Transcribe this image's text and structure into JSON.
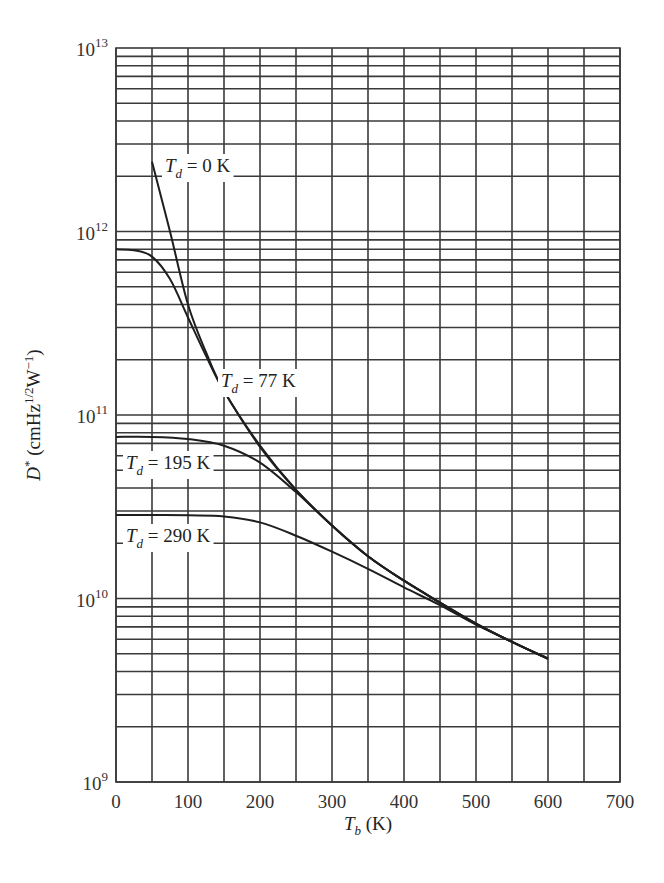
{
  "chart_data": {
    "type": "line",
    "title": "",
    "xlabel": "T_b (K)",
    "xlabel_main": "T",
    "xlabel_sub": "b",
    "xlabel_unit": " (K)",
    "ylabel": "D* (cmHz^1/2 W^-1)",
    "ylabel_parts": {
      "main": "D",
      "star": "*",
      "unit_open": " (cmHz",
      "sup1": "1/2",
      "unit_mid": "W",
      "sup2": "−1",
      "unit_close": ")"
    },
    "xlim": [
      0,
      700
    ],
    "ylim": [
      1000000000.0,
      10000000000000.0
    ],
    "yscale": "log",
    "grid": true,
    "x_ticks": [
      0,
      100,
      200,
      300,
      400,
      500,
      600,
      700
    ],
    "x_minor_grid": [
      50,
      150,
      250,
      350,
      450,
      550,
      650
    ],
    "y_ticks": [
      {
        "base": "10",
        "exp": "9",
        "value": 1000000000.0
      },
      {
        "base": "10",
        "exp": "10",
        "value": 10000000000.0
      },
      {
        "base": "10",
        "exp": "11",
        "value": 100000000000.0
      },
      {
        "base": "10",
        "exp": "12",
        "value": 1000000000000.0
      },
      {
        "base": "10",
        "exp": "13",
        "value": 10000000000000.0
      }
    ],
    "legend_position": "inline labels",
    "series": [
      {
        "name": "T_d = 0 K",
        "label_main": "T",
        "label_sub": "d",
        "label_rest": " = 0 K",
        "label_pos": [
          165,
          172
        ],
        "x": [
          50,
          75,
          100,
          125,
          150,
          200,
          250,
          300,
          350,
          400,
          450,
          500,
          550,
          600
        ],
        "values": [
          2400000000000.0,
          1000000000000.0,
          400000000000.0,
          220000000000.0,
          135000000000.0,
          68000000000.0,
          39000000000.0,
          25000000000.0,
          17000000000.0,
          12500000000.0,
          9500000000.0,
          7300000000.0,
          5800000000.0,
          4700000000.0
        ]
      },
      {
        "name": "T_d = 77 K",
        "label_main": "T",
        "label_sub": "d",
        "label_rest": " = 77 K",
        "label_pos": [
          221,
          387
        ],
        "x": [
          0,
          25,
          50,
          75,
          100,
          125,
          150,
          200,
          250,
          300,
          350,
          400,
          450,
          500,
          550,
          600
        ],
        "values": [
          800000000000.0,
          790000000000.0,
          730000000000.0,
          550000000000.0,
          340000000000.0,
          210000000000.0,
          135000000000.0,
          67000000000.0,
          39000000000.0,
          25000000000.0,
          17000000000.0,
          12500000000.0,
          9500000000.0,
          7300000000.0,
          5800000000.0,
          4700000000.0
        ]
      },
      {
        "name": "T_d = 195 K",
        "label_main": "T",
        "label_sub": "d",
        "label_rest": " = 195 K",
        "label_pos": [
          126,
          469
        ],
        "x": [
          0,
          50,
          100,
          150,
          200,
          250,
          300,
          350,
          400,
          450,
          500,
          550,
          600
        ],
        "values": [
          76000000000.0,
          76000000000.0,
          74000000000.0,
          68000000000.0,
          55000000000.0,
          38000000000.0,
          25000000000.0,
          17000000000.0,
          12500000000.0,
          9500000000.0,
          7300000000.0,
          5800000000.0,
          4700000000.0
        ]
      },
      {
        "name": "T_d = 290 K",
        "label_main": "T",
        "label_sub": "d",
        "label_rest": " = 290 K",
        "label_pos": [
          126,
          542
        ],
        "x": [
          0,
          50,
          100,
          150,
          200,
          250,
          300,
          350,
          400,
          450,
          500,
          550,
          600
        ],
        "values": [
          28500000000.0,
          28500000000.0,
          28400000000.0,
          28000000000.0,
          26000000000.0,
          22000000000.0,
          18000000000.0,
          14500000000.0,
          11500000000.0,
          9200000000.0,
          7200000000.0,
          5800000000.0,
          4700000000.0
        ]
      }
    ]
  },
  "layout": {
    "plot_left": 116,
    "plot_right": 620,
    "plot_top": 48,
    "plot_bottom": 782
  }
}
